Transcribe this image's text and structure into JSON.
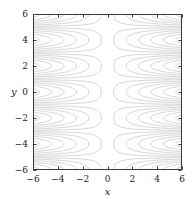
{
  "chart_data": {
    "type": "contour",
    "title": "",
    "subtitle": "",
    "xlabel": "x",
    "ylabel": "y",
    "xlim": [
      -6,
      6
    ],
    "ylim": [
      -6,
      6
    ],
    "xticks": [
      -6,
      -4,
      -2,
      0,
      2,
      4,
      6
    ],
    "xticklabels": [
      "−6",
      "−4",
      "−2",
      "0",
      "2",
      "4",
      "6"
    ],
    "yticks": [
      -6,
      -4,
      -2,
      0,
      2,
      4,
      6
    ],
    "yticklabels": [
      "−6",
      "−4",
      "−2",
      "0",
      "2",
      "4",
      "6"
    ],
    "grid": false,
    "legend": false,
    "legend_position": "none",
    "annotations": [],
    "function": "x*cos(pi*y/2)",
    "levels": [
      -5.5,
      -4.5,
      -3.5,
      -2.5,
      -1.5,
      -0.5,
      0.5,
      1.5,
      2.5,
      3.5,
      4.5,
      5.5
    ],
    "level_count": 12,
    "contour_color": "#b5b5b5",
    "contour_width": 0.6,
    "frame_color": "#3a3a3a",
    "tick_color": "#3a3a3a",
    "background": "#ffffff",
    "grid_resolution": 240
  },
  "plot_area": {
    "left": 33,
    "top": 14,
    "right": 182,
    "bottom": 170,
    "tick_length": 3,
    "x_tick_label_offset": 5,
    "y_tick_label_offset": 5,
    "x_title_offset": 17,
    "y_title_offset": 22
  }
}
